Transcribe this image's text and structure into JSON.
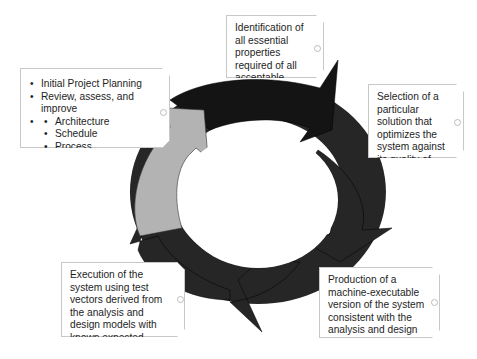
{
  "diagram": {
    "type": "cycle",
    "colors": {
      "segment_dark": "#1a1a1a",
      "segment_mid": "#2a2a2a",
      "segment_light": "#b3b3b3",
      "box_border": "#c8c8c8"
    },
    "boxes": {
      "planning": {
        "items": [
          {
            "label": "Initial Project Planning"
          },
          {
            "label": "Review, assess, and improve",
            "subitems": [
              "Architecture",
              "Schedule",
              "Process"
            ]
          }
        ]
      },
      "identification": {
        "text": "Identification of all essential properties required of all acceptable solutions"
      },
      "selection": {
        "text": "Selection of a particular solution that optimizes the system against its quality of service requirements"
      },
      "production": {
        "text": "Production of a machine-executable version of the system consistent with the analysis and design models"
      },
      "execution": {
        "text": "Execution of the system using test vectors derived from the analysis and design models with known expected results"
      }
    }
  }
}
